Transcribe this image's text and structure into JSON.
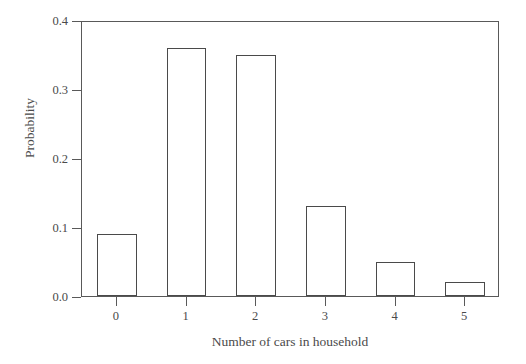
{
  "chart_data": {
    "type": "bar",
    "title": "",
    "xlabel": "Number of cars in household",
    "ylabel": "Probability",
    "categories": [
      "0",
      "1",
      "2",
      "3",
      "4",
      "5"
    ],
    "values": [
      0.09,
      0.36,
      0.35,
      0.13,
      0.05,
      0.02
    ],
    "ylim": [
      0.0,
      0.4
    ],
    "ytick_labels": [
      "0.0",
      "0.1",
      "0.2",
      "0.3",
      "0.4"
    ],
    "ytick_values": [
      0.0,
      0.1,
      0.2,
      0.3,
      0.4
    ],
    "xtick_labels": [
      "0",
      "1",
      "2",
      "3",
      "4",
      "5"
    ],
    "grid": false,
    "legend": null,
    "bar_fill": "#ffffff",
    "bar_edge": "#4a4a4a",
    "axis_color": "#595959",
    "background": "#ffffff"
  }
}
